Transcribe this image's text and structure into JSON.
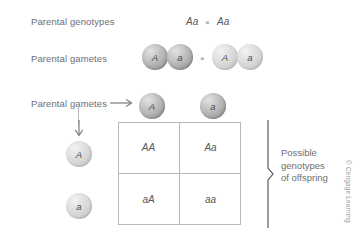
{
  "figure": {
    "background_color": "#ffffff",
    "sphere_dark_color": "#b3b3b4",
    "sphere_light_color": "#d6d6d7",
    "line_color": "#b9babc",
    "text_color": "#6d6e70"
  },
  "rows": {
    "genotypes": {
      "label": "Parental genotypes",
      "parent_left": "Aa",
      "cross_symbol": "×",
      "parent_right": "Aa"
    },
    "gametes": {
      "label": "Parental gametes",
      "cross_symbol": "×",
      "left_pair": [
        "A",
        "a"
      ],
      "right_pair": [
        "A",
        "a"
      ]
    },
    "square_gametes": {
      "label": "Parental gametes",
      "top_alleles": [
        "A",
        "a"
      ],
      "side_alleles": [
        "A",
        "a"
      ]
    }
  },
  "punnett_square": {
    "column_headers": [
      "A",
      "a"
    ],
    "row_headers": [
      "A",
      "a"
    ],
    "cells": [
      [
        "AA",
        "Aa"
      ],
      [
        "aA",
        "aa"
      ]
    ]
  },
  "bracket": {
    "line1": "Possible",
    "line2": "genotypes",
    "line3": "of offspring"
  },
  "credit": {
    "text": "© Cengage Learning"
  }
}
